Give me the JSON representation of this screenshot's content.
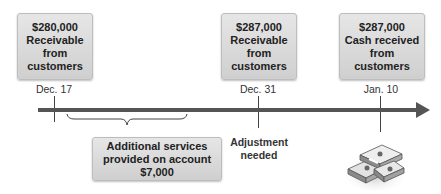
{
  "events": [
    {
      "amount": "$280,000",
      "line1": "Receivable",
      "line2": "from",
      "line3": "customers",
      "date": "Dec. 17"
    },
    {
      "amount": "$287,000",
      "line1": "Receivable",
      "line2": "from",
      "line3": "customers",
      "date": "Dec. 31"
    },
    {
      "amount": "$287,000",
      "line1": "Cash received",
      "line2": "from",
      "line3": "customers",
      "date": "Jan. 10"
    }
  ],
  "period_box": {
    "line1": "Additional services",
    "line2": "provided on account",
    "line3": "$7,000"
  },
  "adjustment_note": {
    "line1": "Adjustment",
    "line2": "needed"
  },
  "icons": {
    "cash": "cash-stack-icon"
  },
  "colors": {
    "box_fill": "#d9d9d9",
    "axis": "#555555",
    "text": "#222222"
  }
}
